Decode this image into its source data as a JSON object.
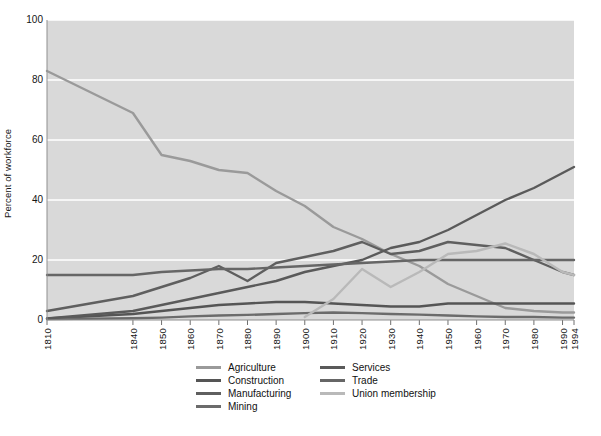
{
  "chart_data": {
    "type": "line",
    "title": "",
    "xlabel": "",
    "ylabel": "Percent of workforce",
    "ylim": [
      0,
      100
    ],
    "yticks": [
      0,
      20,
      40,
      60,
      80,
      100
    ],
    "ytick_labels": [
      "0",
      "20",
      "40",
      "60",
      "80",
      "100"
    ],
    "xlim": [
      1810,
      1994
    ],
    "grid": "horizontal",
    "gridcolor": "#ffffff",
    "plot_background": "#d9d9d9",
    "legend_position": "below-plot",
    "legend_columns": 2,
    "x": [
      1810,
      1840,
      1850,
      1860,
      1870,
      1880,
      1890,
      1900,
      1910,
      1920,
      1930,
      1940,
      1950,
      1960,
      1970,
      1980,
      1990,
      1994
    ],
    "xtick_labels": [
      "1810",
      "1840",
      "1850",
      "1860",
      "1870",
      "1880",
      "1890",
      "1900",
      "1910",
      "1920",
      "1930",
      "1940",
      "1950",
      "1960",
      "1970",
      "1980",
      "1990",
      "1994"
    ],
    "series": [
      {
        "name": "Agriculture",
        "color": "#9a9a9a",
        "values": [
          83,
          69,
          55,
          53,
          50,
          49,
          43,
          38,
          31,
          27,
          22,
          18,
          12,
          8,
          4,
          3,
          2.5,
          2.5
        ]
      },
      {
        "name": "Construction",
        "color": "#555555",
        "values": [
          0.5,
          2,
          3,
          4,
          5,
          5.5,
          6,
          6,
          5.5,
          5,
          4.5,
          4.5,
          5.5,
          5.5,
          5.5,
          5.5,
          5.5,
          5.5
        ]
      },
      {
        "name": "Manufacturing",
        "color": "#5f5f5f",
        "values": [
          3,
          8,
          11,
          14,
          18,
          13,
          19,
          21,
          23,
          26,
          22,
          23,
          26,
          25,
          24,
          20,
          16,
          15
        ]
      },
      {
        "name": "Mining",
        "color": "#6b6b6b",
        "values": [
          0.3,
          0.6,
          0.8,
          1.2,
          1.5,
          1.7,
          2,
          2.3,
          2.5,
          2.3,
          2,
          1.8,
          1.5,
          1.2,
          1,
          1,
          0.8,
          0.8
        ]
      },
      {
        "name": "Services",
        "color": "#5a5a5a",
        "values": [
          0.5,
          3,
          5,
          7,
          9,
          11,
          13,
          16,
          18,
          20,
          24,
          26,
          30,
          35,
          40,
          44,
          49,
          51
        ]
      },
      {
        "name": "Trade",
        "color": "#666666",
        "values": [
          15,
          15,
          16,
          16.5,
          17,
          17,
          17.5,
          18,
          18.5,
          19,
          19.5,
          20,
          20,
          20,
          20,
          20,
          20,
          20
        ]
      },
      {
        "name": "Union membership",
        "color": "#b9b9b9",
        "values": [
          null,
          null,
          null,
          null,
          null,
          null,
          null,
          1,
          7,
          17,
          11,
          16,
          22,
          23,
          25.5,
          22,
          16,
          15
        ]
      }
    ]
  }
}
